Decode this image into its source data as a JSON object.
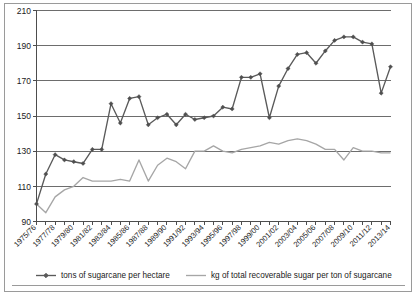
{
  "chart_data": {
    "type": "line",
    "title": "",
    "xlabel": "",
    "ylabel": "",
    "ylim": [
      90,
      210
    ],
    "ytick_labels": [
      "90",
      "110",
      "130",
      "150",
      "170",
      "190",
      "210"
    ],
    "ytick_values": [
      90,
      110,
      130,
      150,
      170,
      190,
      210
    ],
    "grid": true,
    "legend_position": "bottom",
    "x": [
      "1975/76",
      "1976/77",
      "1977/78",
      "1978/79",
      "1979/80",
      "1980/81",
      "1981/82",
      "1982/83",
      "1983/84",
      "1984/85",
      "1985/86",
      "1986/87",
      "1987/88",
      "1988/89",
      "1989/90",
      "1990/91",
      "1991/92",
      "1992/93",
      "1993/94",
      "1994/95",
      "1995/96",
      "1996/97",
      "1997/98",
      "1998/99",
      "1999/00",
      "2000/01",
      "2001/02",
      "2002/03",
      "2003/04",
      "2004/05",
      "2005/06",
      "2006/07",
      "2007/08",
      "2008/09",
      "2009/10",
      "2010/11",
      "2011/12",
      "2012/13",
      "2013/14"
    ],
    "xtick_labels": [
      "1975/76",
      "1977/78",
      "1979/80",
      "1981/82",
      "1983/84",
      "1985/86",
      "1987/88",
      "1989/90",
      "1991/92",
      "1993/94",
      "1995/96",
      "1997/98",
      "1999/00",
      "2001/02",
      "2003/04",
      "2005/06",
      "2007/08",
      "2009/10",
      "2011/12",
      "2013/14"
    ],
    "series": [
      {
        "name": "tons of sugarcane per hectare",
        "color": "#5a5a5a",
        "marker": "diamond",
        "values": [
          100,
          117,
          128,
          125,
          124,
          123,
          131,
          131,
          157,
          146,
          160,
          161,
          145,
          149,
          151,
          145,
          151,
          148,
          149,
          150,
          155,
          154,
          172,
          172,
          174,
          149,
          167,
          177,
          185,
          186,
          180,
          187,
          193,
          195,
          195,
          192,
          191,
          163,
          178
        ]
      },
      {
        "name": "kg of total recoverable sugar per ton of sugarcane",
        "color": "#a6a6a6",
        "marker": "none",
        "values": [
          100,
          95,
          104,
          108,
          110,
          115,
          113,
          113,
          113,
          114,
          113,
          125,
          113,
          122,
          126,
          124,
          120,
          130,
          130,
          133,
          130,
          129,
          131,
          132,
          133,
          135,
          134,
          136,
          137,
          136,
          134,
          131,
          131,
          125,
          132,
          130,
          130,
          129,
          129
        ]
      }
    ],
    "legend": [
      {
        "label": "tons of sugarcane per hectare",
        "color": "#5a5a5a",
        "marker": "diamond"
      },
      {
        "label": "kg of total recoverable sugar per ton of sugarcane",
        "color": "#a6a6a6",
        "marker": "none"
      }
    ]
  }
}
